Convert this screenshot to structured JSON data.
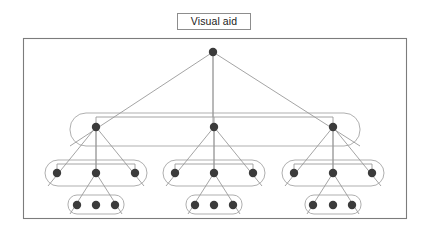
{
  "caption": {
    "label": "Visual aid"
  },
  "figure": {
    "type": "hierarchical-tree-with-nested-groups",
    "frame": {
      "x": 23,
      "y": 38,
      "width": 383,
      "height": 180
    },
    "styles": {
      "frame_stroke": "#7c7c7c",
      "node_fill": "#3b3b3b",
      "edge_stroke": "#9a9a9a",
      "group_stroke": "#a6a6a6",
      "background": "#ffffff",
      "node_radius": 4.2,
      "frame_stroke_width": 1.1,
      "edge_stroke_width": 0.9,
      "group_stroke_width": 0.9
    },
    "levels": [
      {
        "name": "level-1-root",
        "depth": 1,
        "y": 52,
        "node_count": 1,
        "nodes": [
          {
            "id": "r",
            "x": 213,
            "y": 52
          }
        ]
      },
      {
        "name": "level-2-branches",
        "depth": 2,
        "y": 127,
        "node_count": 3,
        "nodes": [
          {
            "id": "b1",
            "x": 96,
            "y": 127
          },
          {
            "id": "b2",
            "x": 214,
            "y": 127
          },
          {
            "id": "b3",
            "x": 333,
            "y": 127
          }
        ]
      },
      {
        "name": "level-3-branches",
        "depth": 3,
        "y": 173,
        "node_count": 9,
        "nodes": [
          {
            "id": "c11",
            "x": 57,
            "y": 173
          },
          {
            "id": "c12",
            "x": 96,
            "y": 173
          },
          {
            "id": "c13",
            "x": 135,
            "y": 173
          },
          {
            "id": "c21",
            "x": 175,
            "y": 173
          },
          {
            "id": "c22",
            "x": 214,
            "y": 173
          },
          {
            "id": "c23",
            "x": 253,
            "y": 173
          },
          {
            "id": "c31",
            "x": 294,
            "y": 173
          },
          {
            "id": "c32",
            "x": 333,
            "y": 173
          },
          {
            "id": "c33",
            "x": 372,
            "y": 173
          }
        ]
      },
      {
        "name": "level-4-leaves",
        "depth": 4,
        "y": 205,
        "node_count": 9,
        "nodes": [
          {
            "id": "d11",
            "x": 77,
            "y": 205
          },
          {
            "id": "d12",
            "x": 96,
            "y": 205
          },
          {
            "id": "d13",
            "x": 115,
            "y": 205
          },
          {
            "id": "d21",
            "x": 195,
            "y": 205
          },
          {
            "id": "d22",
            "x": 214,
            "y": 205
          },
          {
            "id": "d23",
            "x": 233,
            "y": 205
          },
          {
            "id": "d31",
            "x": 313,
            "y": 205
          },
          {
            "id": "d32",
            "x": 333,
            "y": 205
          },
          {
            "id": "d33",
            "x": 352,
            "y": 205
          }
        ]
      }
    ],
    "brackets": [
      {
        "name": "root-bracket",
        "y": 117,
        "x1": 96,
        "x2": 333,
        "stem_from": {
          "x": 213,
          "y": 52
        }
      },
      {
        "name": "group1-bracket",
        "y": 164,
        "x1": 57,
        "x2": 135,
        "stem_from": {
          "x": 96,
          "y": 127
        }
      },
      {
        "name": "group2-bracket",
        "y": 164,
        "x1": 175,
        "x2": 253,
        "stem_from": {
          "x": 214,
          "y": 127
        }
      },
      {
        "name": "group3-bracket",
        "y": 164,
        "x1": 294,
        "x2": 372,
        "stem_from": {
          "x": 333,
          "y": 127
        }
      }
    ],
    "triangles": [
      {
        "name": "root-triangle",
        "apex": {
          "x": 213,
          "y": 52
        },
        "left": {
          "x": 70,
          "y": 146
        },
        "right": {
          "x": 360,
          "y": 146
        }
      },
      {
        "name": "group1-triangle",
        "apex": {
          "x": 96,
          "y": 127
        },
        "left": {
          "x": 48,
          "y": 186
        },
        "right": {
          "x": 144,
          "y": 186
        }
      },
      {
        "name": "group2-triangle",
        "apex": {
          "x": 214,
          "y": 127
        },
        "left": {
          "x": 166,
          "y": 186
        },
        "right": {
          "x": 262,
          "y": 186
        }
      },
      {
        "name": "group3-triangle",
        "apex": {
          "x": 333,
          "y": 127
        },
        "left": {
          "x": 285,
          "y": 186
        },
        "right": {
          "x": 381,
          "y": 186
        }
      },
      {
        "name": "leaf1-triangle",
        "apex": {
          "x": 96,
          "y": 173
        },
        "left": {
          "x": 70,
          "y": 214
        },
        "right": {
          "x": 122,
          "y": 214
        }
      },
      {
        "name": "leaf2-triangle",
        "apex": {
          "x": 214,
          "y": 173
        },
        "left": {
          "x": 188,
          "y": 214
        },
        "right": {
          "x": 240,
          "y": 214
        }
      },
      {
        "name": "leaf3-triangle",
        "apex": {
          "x": 333,
          "y": 173
        },
        "left": {
          "x": 307,
          "y": 214
        },
        "right": {
          "x": 359,
          "y": 214
        }
      }
    ],
    "groups": [
      {
        "name": "group-level2-all",
        "x": 70,
        "y": 113,
        "width": 290,
        "height": 33,
        "radius": 16
      },
      {
        "name": "group-level3-set1",
        "x": 45,
        "y": 160,
        "width": 102,
        "height": 26,
        "radius": 13
      },
      {
        "name": "group-level3-set2",
        "x": 163,
        "y": 160,
        "width": 102,
        "height": 26,
        "radius": 13
      },
      {
        "name": "group-level3-set3",
        "x": 282,
        "y": 160,
        "width": 102,
        "height": 26,
        "radius": 13
      },
      {
        "name": "group-level4-set1",
        "x": 68,
        "y": 195,
        "width": 56,
        "height": 19,
        "radius": 9
      },
      {
        "name": "group-level4-set2",
        "x": 186,
        "y": 195,
        "width": 56,
        "height": 19,
        "radius": 9
      },
      {
        "name": "group-level4-set3",
        "x": 305,
        "y": 195,
        "width": 56,
        "height": 19,
        "radius": 9
      }
    ]
  }
}
